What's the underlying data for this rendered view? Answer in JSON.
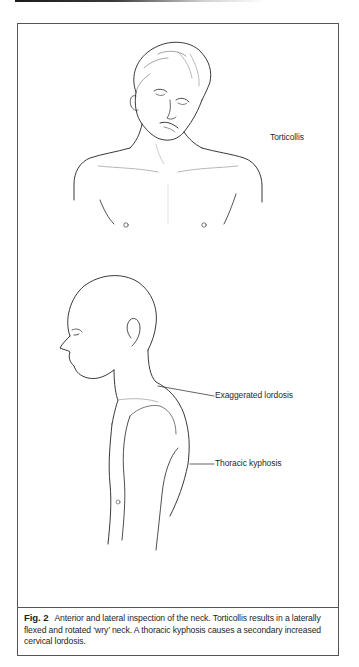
{
  "figure": {
    "number": "Fig. 2",
    "caption": "Anterior and lateral inspection of the neck. Torticollis results in a laterally flexed and rotated ‘wry’ neck. A thoracic kyphosis causes a secondary increased cervical lordosis.",
    "illustrations": [
      {
        "name": "anterior-view-torticollis",
        "description": "Front view of a young man's head and upper torso with head tilted and rotated (wry neck)",
        "labels": [
          {
            "text": "Torticollis"
          }
        ]
      },
      {
        "name": "lateral-view-kyphosis",
        "description": "Left-side profile of a bald man's head and torso showing a curved upper back",
        "labels": [
          {
            "text": "Exaggerated lordosis"
          },
          {
            "text": "Thoracic kyphosis"
          }
        ]
      }
    ]
  }
}
